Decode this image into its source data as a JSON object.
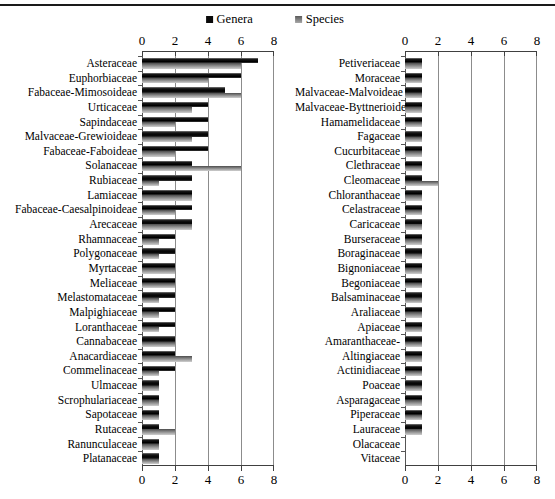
{
  "header": {
    "legend": [
      {
        "label": "Genera",
        "swatch": "#0a0a0a"
      },
      {
        "label": "Species",
        "swatch": "#8c8c8c"
      }
    ]
  },
  "colors": {
    "genera_bar": "#0a0a0a",
    "species_bar": "#8e8e8e",
    "gridline": "#8c8c8c",
    "axis_line": "#404040",
    "top_rule": "#1a1a1a",
    "background": "#ffffff"
  },
  "chart_data": [
    {
      "type": "bar",
      "orientation": "horizontal",
      "title": "",
      "xlabel": "",
      "ylabel": "",
      "xlim": [
        0,
        8
      ],
      "ticks": [
        0,
        2,
        4,
        6,
        8
      ],
      "grid": true,
      "legend_position": "top",
      "categories": [
        "Asteraceae",
        "Euphorbiaceae",
        "Fabaceae-Mimosoideae",
        "Urticaceae",
        "Sapindaceae",
        "Malvaceae-Grewioideae",
        "Fabaceae-Faboideae",
        "Solanaceae",
        "Rubiaceae",
        "Lamiaceae",
        "Fabaceae-Caesalpinoideae",
        "Arecaceae",
        "Rhamnaceae",
        "Polygonaceae",
        "Myrtaceae",
        "Meliaceae",
        "Melastomataceae",
        "Malpighiaceae",
        "Loranthaceae",
        "Cannabaceae",
        "Anacardiaceae",
        "Commelinaceae",
        "Ulmaceae",
        "Scrophulariaceae",
        "Sapotaceae",
        "Rutaceae",
        "Ranunculaceae",
        "Platanaceae"
      ],
      "series": [
        {
          "name": "Genera",
          "color": "#0a0a0a",
          "values": [
            7,
            6,
            5,
            4,
            4,
            4,
            4,
            3,
            3,
            3,
            3,
            3,
            2,
            2,
            2,
            2,
            2,
            2,
            2,
            2,
            2,
            2,
            1,
            1,
            1,
            1,
            1,
            1
          ]
        },
        {
          "name": "Species",
          "color": "#8e8e8e",
          "values": [
            6,
            4,
            6,
            3,
            2,
            3,
            2,
            6,
            1,
            3,
            2,
            3,
            1,
            1,
            2,
            2,
            1,
            1,
            1,
            2,
            3,
            1,
            1,
            1,
            1,
            2,
            1,
            1
          ]
        }
      ]
    },
    {
      "type": "bar",
      "orientation": "horizontal",
      "title": "",
      "xlabel": "",
      "ylabel": "",
      "xlim": [
        0,
        8
      ],
      "ticks": [
        0,
        2,
        4,
        6,
        8
      ],
      "grid": true,
      "legend_position": "top",
      "categories": [
        "Petiveriaceae",
        "Moraceae",
        "Malvaceae-Malvoideae",
        "Malvaceae-Byttnerioideae",
        "Hamamelidaceae",
        "Fagaceae",
        "Cucurbitaceae",
        "Clethraceae",
        "Cleomaceae",
        "Chloranthaceae",
        "Celastraceae",
        "Caricaceae",
        "Burseraceae",
        "Boraginaceae",
        "Bignoniaceae",
        "Begoniaceae",
        "Balsaminaceae",
        "Araliaceae",
        "Apiaceae",
        "Amaranthaceae-",
        "Altingiaceae",
        "Actinidiaceae",
        "Poaceae",
        "Asparagaceae",
        "Piperaceae",
        "Lauraceae",
        "Olacaceae",
        "Vitaceae"
      ],
      "series": [
        {
          "name": "Genera",
          "color": "#0a0a0a",
          "values": [
            1,
            1,
            1,
            1,
            1,
            1,
            1,
            1,
            1,
            1,
            1,
            1,
            1,
            1,
            1,
            1,
            1,
            1,
            1,
            1,
            1,
            1,
            1,
            1,
            1,
            1,
            0,
            0
          ]
        },
        {
          "name": "Species",
          "color": "#8e8e8e",
          "values": [
            1,
            1,
            1,
            1,
            1,
            1,
            1,
            1,
            2,
            1,
            1,
            1,
            1,
            1,
            1,
            1,
            1,
            1,
            1,
            1,
            1,
            1,
            1,
            1,
            1,
            1,
            0,
            0
          ]
        }
      ]
    }
  ]
}
